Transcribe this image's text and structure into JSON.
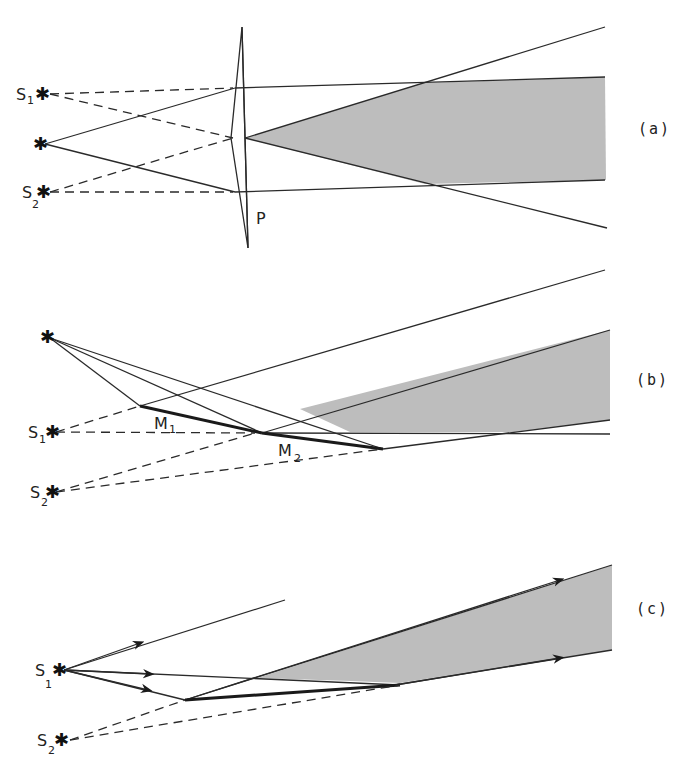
{
  "figure": {
    "panels": [
      {
        "id": "a",
        "label": "(a)",
        "sources": {
          "s1": "S",
          "s1_sub": "1",
          "s2": "S",
          "s2_sub": "2"
        },
        "element_label": "P"
      },
      {
        "id": "b",
        "label": "(b)",
        "sources": {
          "s1": "S",
          "s1_sub": "1",
          "s2": "S",
          "s2_sub": "2"
        },
        "mirror1": "M",
        "mirror1_sub": "1",
        "mirror2": "M",
        "mirror2_sub": "2"
      },
      {
        "id": "c",
        "label": "(c)",
        "sources": {
          "s1": "S",
          "s1_sub": "1",
          "s2": "S",
          "s2_sub": "2"
        }
      }
    ],
    "colors": {
      "line": "#2a2a2a",
      "shaded_overlap": "#bdbdbd",
      "background": "#ffffff"
    },
    "star_glyph": "✱"
  }
}
